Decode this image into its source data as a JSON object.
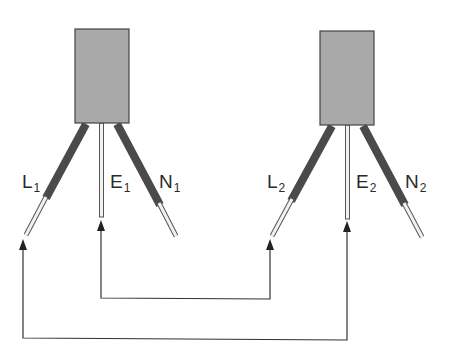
{
  "colors": {
    "box_fill": "#a9a9a9",
    "box_stroke": "#444444",
    "insulation": "#4a4a4a",
    "conductor_fill": "#f2f2f2",
    "conductor_stroke": "#555555",
    "connector_line": "#333333"
  },
  "units": [
    {
      "id": "unit-1",
      "wires": [
        {
          "letter": "L",
          "sub": "1"
        },
        {
          "letter": "E",
          "sub": "1"
        },
        {
          "letter": "N",
          "sub": "1"
        }
      ]
    },
    {
      "id": "unit-2",
      "wires": [
        {
          "letter": "L",
          "sub": "2"
        },
        {
          "letter": "E",
          "sub": "2"
        },
        {
          "letter": "N",
          "sub": "2"
        }
      ]
    }
  ],
  "connections": [
    {
      "from": "E1",
      "to": "L2"
    },
    {
      "from": "L1",
      "to": "E2"
    }
  ]
}
